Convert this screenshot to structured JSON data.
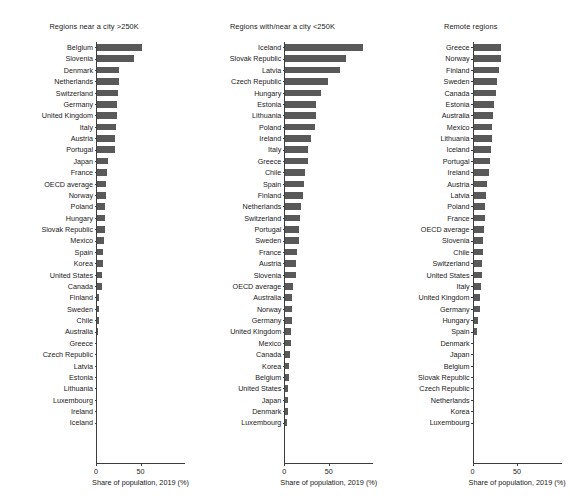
{
  "figure": {
    "xaxis_title": "Share of population, 2019 (%)",
    "xticks": [
      "0",
      "50"
    ],
    "xtick_values": [
      0,
      50
    ]
  },
  "chart_data": [
    {
      "type": "bar",
      "orientation": "horizontal",
      "title": "Regions near a city >250K",
      "xlabel": "Share of population, 2019 (%)",
      "ylabel": "",
      "xlim": [
        0,
        100
      ],
      "grid": false,
      "bar_color": "#595959",
      "categories": [
        "Belgium",
        "Slovenia",
        "Denmark",
        "Netherlands",
        "Switzerland",
        "Germany",
        "United Kingdom",
        "Italy",
        "Austria",
        "Portugal",
        "Japan",
        "France",
        "OECD average",
        "Norway",
        "Poland",
        "Hungary",
        "Slovak Republic",
        "Mexico",
        "Spain",
        "Korea",
        "United States",
        "Canada",
        "Finland",
        "Sweden",
        "Chile",
        "Australia",
        "Greece",
        "Czech Republic",
        "Latvia",
        "Estonia",
        "Lithuania",
        "Luxembourg",
        "Ireland",
        "Iceland"
      ],
      "values": [
        51.0,
        42.0,
        25.0,
        24.5,
        24.0,
        23.0,
        22.0,
        21.5,
        20.5,
        20.0,
        12.5,
        11.0,
        10.5,
        10.0,
        9.5,
        9.0,
        8.5,
        8.0,
        7.0,
        6.5,
        6.0,
        5.5,
        2.5,
        2.2,
        2.0,
        1.5,
        0.0,
        0.0,
        0.0,
        0.0,
        0.0,
        0.0,
        0.0,
        0.0
      ]
    },
    {
      "type": "bar",
      "orientation": "horizontal",
      "title": "Regions with/near a city <250K",
      "xlabel": "Share of population, 2019 (%)",
      "ylabel": "",
      "xlim": [
        0,
        100
      ],
      "grid": false,
      "bar_color": "#595959",
      "categories": [
        "Iceland",
        "Slovak Republic",
        "Latvia",
        "Czech Republic",
        "Hungary",
        "Estonia",
        "Lithuania",
        "Poland",
        "Ireland",
        "Italy",
        "Greece",
        "Chile",
        "Spain",
        "Finland",
        "Netherlands",
        "Switzerland",
        "Portugal",
        "Sweden",
        "France",
        "Austria",
        "Slovenia",
        "OECD average",
        "Australia",
        "Norway",
        "Germany",
        "United Kingdom",
        "Mexico",
        "Canada",
        "Korea",
        "Belgium",
        "United States",
        "Japan",
        "Denmark",
        "Luxembourg"
      ],
      "values": [
        87.0,
        68.0,
        62.0,
        48.0,
        40.0,
        35.0,
        34.5,
        33.0,
        28.5,
        26.0,
        25.5,
        22.0,
        21.0,
        19.5,
        18.0,
        16.5,
        15.5,
        15.0,
        13.5,
        12.5,
        11.5,
        8.5,
        8.0,
        7.5,
        7.0,
        6.5,
        6.0,
        5.0,
        4.5,
        4.0,
        3.5,
        3.0,
        2.5,
        2.0
      ]
    },
    {
      "type": "bar",
      "orientation": "horizontal",
      "title": "Remote regions",
      "xlabel": "Share of population, 2019 (%)",
      "ylabel": "",
      "xlim": [
        0,
        100
      ],
      "grid": false,
      "bar_color": "#595959",
      "categories": [
        "Greece",
        "Norway",
        "Finland",
        "Sweden",
        "Canada",
        "Estonia",
        "Australia",
        "Mexico",
        "Lithuania",
        "Iceland",
        "Portugal",
        "Ireland",
        "Austria",
        "Latvia",
        "Poland",
        "France",
        "OECD average",
        "Slovenia",
        "Chile",
        "Switzerland",
        "United States",
        "Italy",
        "United Kingdom",
        "Germany",
        "Hungary",
        "Spain",
        "Denmark",
        "Japan",
        "Belgium",
        "Slovak Republic",
        "Czech Republic",
        "Netherlands",
        "Korea",
        "Luxembourg"
      ],
      "values": [
        31.0,
        30.5,
        29.0,
        26.0,
        25.5,
        23.0,
        22.0,
        21.0,
        20.5,
        19.0,
        18.5,
        17.5,
        15.5,
        14.0,
        13.0,
        12.5,
        12.0,
        11.0,
        10.5,
        10.0,
        9.5,
        8.0,
        7.5,
        7.0,
        5.0,
        4.0,
        0.0,
        0.0,
        0.0,
        0.0,
        0.0,
        0.0,
        0.0,
        0.0
      ]
    }
  ]
}
